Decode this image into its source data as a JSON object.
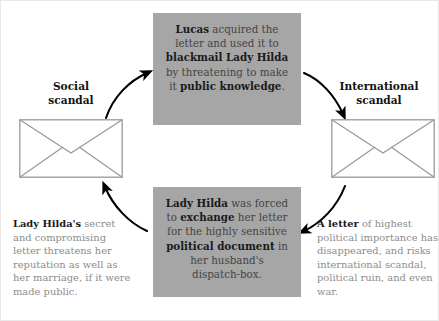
{
  "diagram": {
    "colors": {
      "card_background": "#a6a6a6",
      "card_body_text": "#444444",
      "card_bold_text": "#1a1a1a",
      "paragraph_text": "#8c8c8c",
      "paragraph_bold_text": "#1a1a1a",
      "arrow": "#000000",
      "envelope_stroke": "#9a9a9a",
      "canvas": "#ffffff"
    },
    "cards": {
      "top": {
        "name": "lucas-blackmail-card",
        "segments": [
          {
            "text": "Lucas",
            "bold": true
          },
          {
            "text": " acquired the letter and used it to ",
            "bold": false
          },
          {
            "text": "blackmail Lady Hilda",
            "bold": true
          },
          {
            "text": " by threatening to make it ",
            "bold": false
          },
          {
            "text": "public knowledge",
            "bold": true
          },
          {
            "text": ".",
            "bold": false
          }
        ]
      },
      "bottom": {
        "name": "lady-hilda-exchange-card",
        "segments": [
          {
            "text": "Lady Hilda",
            "bold": true
          },
          {
            "text": " was forced to ",
            "bold": false
          },
          {
            "text": "exchange",
            "bold": true
          },
          {
            "text": " her letter for the highly sensitive ",
            "bold": false
          },
          {
            "text": "political document",
            "bold": true
          },
          {
            "text": " in her husband's dispatch-box.",
            "bold": false
          }
        ]
      }
    },
    "nodes": {
      "left": {
        "label_line1": "Social",
        "label_line2": "scandal",
        "icon": "envelope-icon"
      },
      "right": {
        "label_line1": "International",
        "label_line2": "scandal",
        "icon": "envelope-icon"
      }
    },
    "paragraphs": {
      "left": {
        "name": "social-scandal-description",
        "segments": [
          {
            "text": "Lady Hilda's",
            "bold": true
          },
          {
            "text": " secret and compromising letter threatens her reputation as well as her marriage, if it were made public.",
            "bold": false
          }
        ]
      },
      "right": {
        "name": "international-scandal-description",
        "segments": [
          {
            "text": "A letter",
            "bold": true
          },
          {
            "text": " of highest political importance has disappeared, and risks international scandal, political ruin, and even war.",
            "bold": false
          }
        ]
      }
    },
    "arrows": [
      {
        "name": "arrow-social-to-lucas",
        "from": "social-scandal",
        "to": "lucas-blackmail-card",
        "direction": "up-right"
      },
      {
        "name": "arrow-lucas-to-international",
        "from": "lucas-blackmail-card",
        "to": "international-scandal",
        "direction": "down-right"
      },
      {
        "name": "arrow-international-to-hilda",
        "from": "international-scandal",
        "to": "lady-hilda-exchange-card",
        "direction": "down-left"
      },
      {
        "name": "arrow-hilda-to-social",
        "from": "lady-hilda-exchange-card",
        "to": "social-scandal",
        "direction": "up-left"
      }
    ]
  }
}
